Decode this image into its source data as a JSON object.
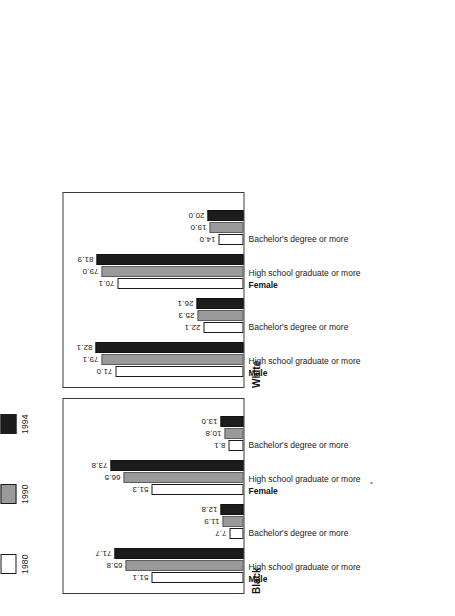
{
  "legend": {
    "entries": [
      {
        "label": "1980",
        "color": "#ffffff",
        "swatch": "legend-swatch-1980"
      },
      {
        "label": "1990",
        "color": "#9a9a9a",
        "swatch": "legend-swatch-1990"
      },
      {
        "label": "1994",
        "color": "#1c1c1c",
        "swatch": "legend-swatch-1994"
      }
    ]
  },
  "panels": [
    {
      "title": "Black",
      "groups": [
        {
          "sex": "Male",
          "education": "High school graduate or more",
          "values": {
            "y1980": "51.1",
            "y1990": "65.8",
            "y1994": "71.7"
          }
        },
        {
          "sex": "",
          "education": "Bachelor's degree or more",
          "values": {
            "y1980": "7.7",
            "y1990": "11.9",
            "y1994": "12.8"
          }
        },
        {
          "sex": "Female",
          "education": "High school graduate or more",
          "values": {
            "y1980": "51.3",
            "y1990": "66.5",
            "y1994": "73.8"
          }
        },
        {
          "sex": "",
          "education": "Bachelor's degree or more",
          "values": {
            "y1980": "8.1",
            "y1990": "10.8",
            "y1994": "13.0"
          }
        }
      ]
    },
    {
      "title": "White",
      "groups": [
        {
          "sex": "Male",
          "education": "High school graduate or more",
          "values": {
            "y1980": "71.0",
            "y1990": "79.1",
            "y1994": "82.1"
          }
        },
        {
          "sex": "",
          "education": "Bachelor's degree or more",
          "values": {
            "y1980": "22.1",
            "y1990": "25.3",
            "y1994": "26.1"
          }
        },
        {
          "sex": "Female",
          "education": "High school graduate or more",
          "values": {
            "y1980": "70.1",
            "y1990": "79.0",
            "y1994": "81.9"
          }
        },
        {
          "sex": "",
          "education": "Bachelor's degree or more",
          "values": {
            "y1980": "14.0",
            "y1990": "19.0",
            "y1994": "20.0"
          }
        }
      ]
    }
  ],
  "chart_data": {
    "type": "bar",
    "title": "",
    "xlabel": "",
    "ylabel": "Percent",
    "ylim": [
      0,
      100
    ],
    "grid": false,
    "legend_position": "top-left",
    "orientation": "vertical-bars-rotated-90ccw",
    "series": [
      {
        "name": "1980",
        "color": "#ffffff"
      },
      {
        "name": "1990",
        "color": "#9a9a9a"
      },
      {
        "name": "1994",
        "color": "#1c1c1c"
      }
    ],
    "panels": [
      {
        "name": "Black",
        "categories": [
          "Male - High school graduate or more",
          "Male - Bachelor's degree or more",
          "Female - High school graduate or more",
          "Female - Bachelor's degree or more"
        ],
        "series": [
          {
            "name": "1980",
            "values": [
              51.1,
              7.7,
              51.3,
              8.1
            ]
          },
          {
            "name": "1990",
            "values": [
              65.8,
              11.9,
              66.5,
              10.8
            ]
          },
          {
            "name": "1994",
            "values": [
              71.7,
              12.8,
              73.8,
              13.0
            ]
          }
        ]
      },
      {
        "name": "White",
        "categories": [
          "Male - High school graduate or more",
          "Male - Bachelor's degree or more",
          "Female - High school graduate or more",
          "Female - Bachelor's degree or more"
        ],
        "series": [
          {
            "name": "1980",
            "values": [
              71.0,
              22.1,
              70.1,
              14.0
            ]
          },
          {
            "name": "1990",
            "values": [
              79.1,
              25.3,
              79.0,
              19.0
            ]
          },
          {
            "name": "1994",
            "values": [
              82.1,
              26.1,
              81.9,
              20.0
            ]
          }
        ]
      }
    ]
  }
}
